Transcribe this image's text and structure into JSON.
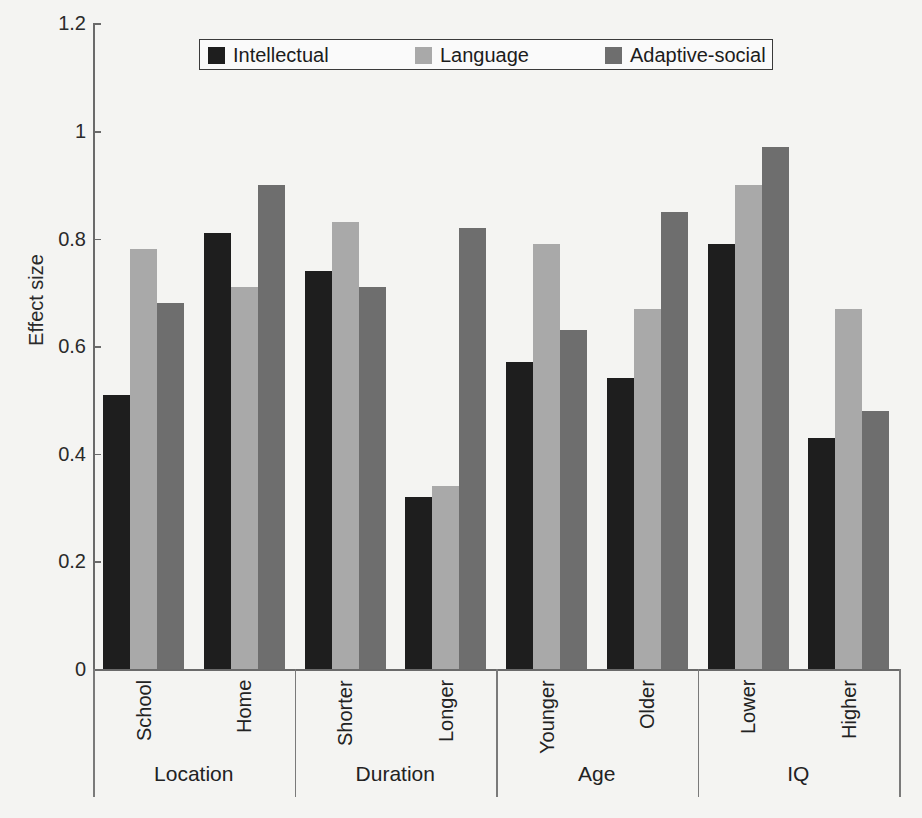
{
  "chart_data": {
    "type": "bar",
    "title": "",
    "xlabel": "",
    "ylabel": "Effect size",
    "ylim": [
      0,
      1.2
    ],
    "yticks": [
      "0",
      "0.2",
      "0.4",
      "0.6",
      "0.8",
      "1",
      "1.2"
    ],
    "grid": false,
    "legend_position": "top-center",
    "categories": [
      "School",
      "Home",
      "Shorter",
      "Longer",
      "Younger",
      "Older",
      "Lower",
      "Higher"
    ],
    "groups": [
      {
        "label": "Location",
        "categories": [
          "School",
          "Home"
        ]
      },
      {
        "label": "Duration",
        "categories": [
          "Shorter",
          "Longer"
        ]
      },
      {
        "label": "Age",
        "categories": [
          "Younger",
          "Older"
        ]
      },
      {
        "label": "IQ",
        "categories": [
          "Lower",
          "Higher"
        ]
      }
    ],
    "series": [
      {
        "name": "Intellectual",
        "color": "#1e1e1e",
        "values": [
          0.51,
          0.81,
          0.74,
          0.32,
          0.57,
          0.54,
          0.79,
          0.43
        ]
      },
      {
        "name": "Language",
        "color": "#a9a9a9",
        "values": [
          0.78,
          0.71,
          0.83,
          0.34,
          0.79,
          0.67,
          0.9,
          0.67
        ]
      },
      {
        "name": "Adaptive-social",
        "color": "#6e6e6e",
        "values": [
          0.68,
          0.9,
          0.71,
          0.82,
          0.63,
          0.85,
          0.97,
          0.48
        ]
      }
    ]
  },
  "legend": {
    "items": [
      "Intellectual",
      "Language",
      "Adaptive-social"
    ]
  },
  "axis": {
    "ylabel": "Effect size"
  }
}
